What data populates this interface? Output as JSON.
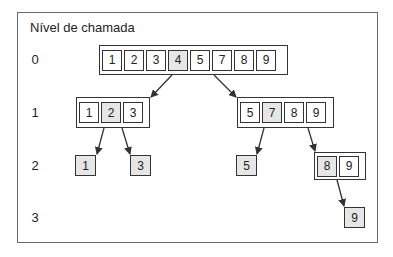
{
  "title": "Nível de chamada",
  "levels": [
    "0",
    "1",
    "2",
    "3"
  ],
  "colors": {
    "pivot_fill": "#e6e6e6",
    "border": "#333333",
    "frame": "#6a6a6a"
  },
  "nodes": {
    "level0": {
      "cells": [
        "1",
        "2",
        "3",
        "4",
        "5",
        "7",
        "8",
        "9"
      ],
      "pivot_index": 3
    },
    "level1_left": {
      "cells": [
        "1",
        "2",
        "3"
      ],
      "pivot_index": 1
    },
    "level1_right": {
      "cells": [
        "5",
        "7",
        "8",
        "9"
      ],
      "pivot_index": 1
    },
    "level2_a": {
      "value": "1"
    },
    "level2_b": {
      "value": "3"
    },
    "level2_c": {
      "value": "5"
    },
    "level2_right": {
      "cells": [
        "8",
        "9"
      ],
      "pivot_index": 0
    },
    "level3_a": {
      "value": "9"
    }
  }
}
